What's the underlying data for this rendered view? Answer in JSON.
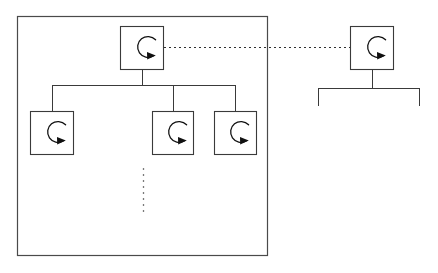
{
  "diagram": {
    "canvas": {
      "width": 438,
      "height": 273,
      "background": "#ffffff"
    },
    "colors": {
      "line": "#3a3a3a",
      "group_border": "#4a4a4a",
      "node_border": "#3a3a3a",
      "node_fill": "#ffffff",
      "icon": "#111111",
      "ellipsis": "#7a7a7a"
    },
    "groups": [
      {
        "id": "main-group",
        "label": "",
        "x": 17,
        "y": 16,
        "width": 251,
        "height": 240
      }
    ],
    "nodes": [
      {
        "id": "root-node",
        "icon": "cycle-arrow-icon",
        "label": "",
        "x": 120,
        "y": 26,
        "width": 44,
        "height": 44,
        "group": "main-group",
        "role": "root"
      },
      {
        "id": "child-node-1",
        "icon": "cycle-arrow-icon",
        "label": "",
        "x": 30,
        "y": 111,
        "width": 44,
        "height": 44,
        "group": "main-group",
        "role": "child"
      },
      {
        "id": "child-node-2",
        "icon": "cycle-arrow-icon",
        "label": "",
        "x": 152,
        "y": 111,
        "width": 42,
        "height": 44,
        "group": "main-group",
        "role": "child"
      },
      {
        "id": "child-node-3",
        "icon": "cycle-arrow-icon",
        "label": "",
        "x": 214,
        "y": 111,
        "width": 43,
        "height": 44,
        "group": "main-group",
        "role": "child"
      },
      {
        "id": "external-node",
        "icon": "cycle-arrow-icon",
        "label": "",
        "x": 350,
        "y": 26,
        "width": 44,
        "height": 44,
        "group": null,
        "role": "external-root"
      }
    ],
    "connectors": [
      {
        "id": "root-stem",
        "type": "solid",
        "from": "root-node",
        "to": "child-bus"
      },
      {
        "id": "child-bus",
        "type": "solid-bus",
        "y": 85,
        "x1": 52,
        "x2": 236
      },
      {
        "id": "bus-to-child-1",
        "type": "solid",
        "from": "child-bus",
        "to": "child-node-1"
      },
      {
        "id": "bus-to-child-2",
        "type": "solid",
        "from": "child-bus",
        "to": "child-node-2"
      },
      {
        "id": "bus-to-child-3",
        "type": "solid",
        "from": "child-bus",
        "to": "child-node-3"
      },
      {
        "id": "external-stem",
        "type": "solid",
        "from": "external-node",
        "to": "external-bus"
      },
      {
        "id": "external-bus",
        "type": "solid-bus",
        "y": 88,
        "x1": 318,
        "x2": 420
      },
      {
        "id": "external-bus-left-drop",
        "type": "solid",
        "x": 318,
        "y1": 88,
        "y2": 106
      },
      {
        "id": "external-bus-right-drop",
        "type": "solid",
        "x": 420,
        "y1": 88,
        "y2": 106
      }
    ],
    "dotted_links": [
      {
        "id": "root-to-external-link",
        "type": "dotted",
        "from": "root-node",
        "to": "external-node",
        "x1": 164,
        "y1": 47,
        "x2": 350,
        "y2": 47
      }
    ],
    "ellipses": [
      {
        "id": "vertical-ellipsis",
        "type": "dotted-vertical",
        "meaning": "more-items-omitted",
        "x": 143,
        "y1": 168,
        "y2": 212
      }
    ],
    "icon_legend": {
      "cycle-arrow-icon": "circular refresh / process-cycle arrow, C-shaped arc open to the right with arrowhead pointing right"
    }
  }
}
